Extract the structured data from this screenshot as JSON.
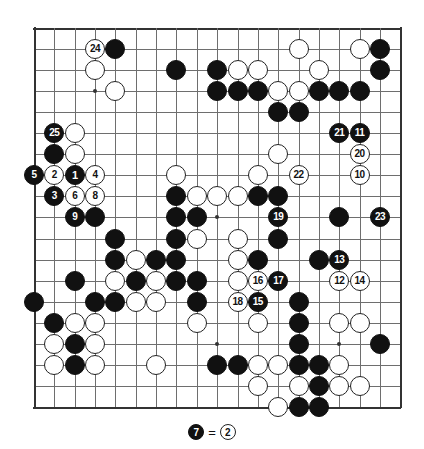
{
  "board": {
    "size": 19,
    "title": "Go game diagram",
    "geometry": {
      "left": 34,
      "top": 28,
      "x_step": 20.35,
      "y_step": 21.05,
      "stone_diameter": 20
    },
    "colors": {
      "black": "#111111",
      "white": "#ffffff",
      "line": "#6e6e6e",
      "edge": "#333333",
      "background": "#ffffff"
    },
    "star_points": [
      {
        "col": 4,
        "row": 4
      },
      {
        "col": 10,
        "row": 4
      },
      {
        "col": 16,
        "row": 4
      },
      {
        "col": 4,
        "row": 10
      },
      {
        "col": 10,
        "row": 10
      },
      {
        "col": 16,
        "row": 10
      },
      {
        "col": 4,
        "row": 16
      },
      {
        "col": 10,
        "row": 16
      },
      {
        "col": 16,
        "row": 16
      }
    ],
    "stones": [
      {
        "col": 4,
        "row": 2,
        "color": "white",
        "label": "24"
      },
      {
        "col": 5,
        "row": 2,
        "color": "black",
        "label": ""
      },
      {
        "col": 14,
        "row": 2,
        "color": "white",
        "label": ""
      },
      {
        "col": 17,
        "row": 2,
        "color": "white",
        "label": ""
      },
      {
        "col": 18,
        "row": 2,
        "color": "black",
        "label": ""
      },
      {
        "col": 4,
        "row": 3,
        "color": "white",
        "label": ""
      },
      {
        "col": 8,
        "row": 3,
        "color": "black",
        "label": ""
      },
      {
        "col": 10,
        "row": 3,
        "color": "black",
        "label": ""
      },
      {
        "col": 11,
        "row": 3,
        "color": "white",
        "label": ""
      },
      {
        "col": 12,
        "row": 3,
        "color": "white",
        "label": ""
      },
      {
        "col": 15,
        "row": 3,
        "color": "white",
        "label": ""
      },
      {
        "col": 18,
        "row": 3,
        "color": "black",
        "label": ""
      },
      {
        "col": 5,
        "row": 4,
        "color": "white",
        "label": ""
      },
      {
        "col": 10,
        "row": 4,
        "color": "black",
        "label": ""
      },
      {
        "col": 11,
        "row": 4,
        "color": "black",
        "label": ""
      },
      {
        "col": 12,
        "row": 4,
        "color": "black",
        "label": ""
      },
      {
        "col": 13,
        "row": 4,
        "color": "white",
        "label": ""
      },
      {
        "col": 14,
        "row": 4,
        "color": "white",
        "label": ""
      },
      {
        "col": 15,
        "row": 4,
        "color": "black",
        "label": ""
      },
      {
        "col": 16,
        "row": 4,
        "color": "black",
        "label": ""
      },
      {
        "col": 17,
        "row": 4,
        "color": "black",
        "label": ""
      },
      {
        "col": 13,
        "row": 5,
        "color": "black",
        "label": ""
      },
      {
        "col": 14,
        "row": 5,
        "color": "black",
        "label": ""
      },
      {
        "col": 2,
        "row": 6,
        "color": "black",
        "label": "25"
      },
      {
        "col": 3,
        "row": 6,
        "color": "white",
        "label": ""
      },
      {
        "col": 16,
        "row": 6,
        "color": "black",
        "label": "21"
      },
      {
        "col": 17,
        "row": 6,
        "color": "black",
        "label": "11"
      },
      {
        "col": 2,
        "row": 7,
        "color": "black",
        "label": ""
      },
      {
        "col": 3,
        "row": 7,
        "color": "white",
        "label": ""
      },
      {
        "col": 13,
        "row": 7,
        "color": "white",
        "label": ""
      },
      {
        "col": 17,
        "row": 7,
        "color": "white",
        "label": "20"
      },
      {
        "col": 1,
        "row": 8,
        "color": "black",
        "label": "5"
      },
      {
        "col": 2,
        "row": 8,
        "color": "white",
        "label": "2"
      },
      {
        "col": 3,
        "row": 8,
        "color": "black",
        "label": "1"
      },
      {
        "col": 4,
        "row": 8,
        "color": "white",
        "label": "4"
      },
      {
        "col": 8,
        "row": 8,
        "color": "white",
        "label": ""
      },
      {
        "col": 12,
        "row": 8,
        "color": "white",
        "label": ""
      },
      {
        "col": 14,
        "row": 8,
        "color": "white",
        "label": "22"
      },
      {
        "col": 17,
        "row": 8,
        "color": "white",
        "label": "10"
      },
      {
        "col": 2,
        "row": 9,
        "color": "black",
        "label": "3"
      },
      {
        "col": 3,
        "row": 9,
        "color": "white",
        "label": "6"
      },
      {
        "col": 4,
        "row": 9,
        "color": "white",
        "label": "8"
      },
      {
        "col": 8,
        "row": 9,
        "color": "black",
        "label": ""
      },
      {
        "col": 9,
        "row": 9,
        "color": "white",
        "label": ""
      },
      {
        "col": 10,
        "row": 9,
        "color": "white",
        "label": ""
      },
      {
        "col": 11,
        "row": 9,
        "color": "white",
        "label": ""
      },
      {
        "col": 12,
        "row": 9,
        "color": "black",
        "label": ""
      },
      {
        "col": 13,
        "row": 9,
        "color": "black",
        "label": ""
      },
      {
        "col": 3,
        "row": 10,
        "color": "black",
        "label": "9"
      },
      {
        "col": 4,
        "row": 10,
        "color": "black",
        "label": ""
      },
      {
        "col": 8,
        "row": 10,
        "color": "black",
        "label": ""
      },
      {
        "col": 9,
        "row": 10,
        "color": "black",
        "label": ""
      },
      {
        "col": 13,
        "row": 10,
        "color": "black",
        "label": "19"
      },
      {
        "col": 16,
        "row": 10,
        "color": "black",
        "label": ""
      },
      {
        "col": 18,
        "row": 10,
        "color": "black",
        "label": "23"
      },
      {
        "col": 5,
        "row": 11,
        "color": "black",
        "label": ""
      },
      {
        "col": 8,
        "row": 11,
        "color": "black",
        "label": ""
      },
      {
        "col": 9,
        "row": 11,
        "color": "white",
        "label": ""
      },
      {
        "col": 11,
        "row": 11,
        "color": "white",
        "label": ""
      },
      {
        "col": 13,
        "row": 11,
        "color": "black",
        "label": ""
      },
      {
        "col": 5,
        "row": 12,
        "color": "black",
        "label": ""
      },
      {
        "col": 6,
        "row": 12,
        "color": "white",
        "label": ""
      },
      {
        "col": 7,
        "row": 12,
        "color": "black",
        "label": ""
      },
      {
        "col": 8,
        "row": 12,
        "color": "black",
        "label": ""
      },
      {
        "col": 11,
        "row": 12,
        "color": "white",
        "label": ""
      },
      {
        "col": 12,
        "row": 12,
        "color": "black",
        "label": ""
      },
      {
        "col": 15,
        "row": 12,
        "color": "black",
        "label": ""
      },
      {
        "col": 16,
        "row": 12,
        "color": "black",
        "label": "13"
      },
      {
        "col": 3,
        "row": 13,
        "color": "black",
        "label": ""
      },
      {
        "col": 5,
        "row": 13,
        "color": "white",
        "label": ""
      },
      {
        "col": 6,
        "row": 13,
        "color": "black",
        "label": ""
      },
      {
        "col": 7,
        "row": 13,
        "color": "white",
        "label": ""
      },
      {
        "col": 8,
        "row": 13,
        "color": "black",
        "label": ""
      },
      {
        "col": 9,
        "row": 13,
        "color": "black",
        "label": ""
      },
      {
        "col": 11,
        "row": 13,
        "color": "white",
        "label": ""
      },
      {
        "col": 12,
        "row": 13,
        "color": "white",
        "label": "16"
      },
      {
        "col": 13,
        "row": 13,
        "color": "black",
        "label": "17"
      },
      {
        "col": 16,
        "row": 13,
        "color": "white",
        "label": "12"
      },
      {
        "col": 17,
        "row": 13,
        "color": "white",
        "label": "14"
      },
      {
        "col": 1,
        "row": 14,
        "color": "black",
        "label": ""
      },
      {
        "col": 4,
        "row": 14,
        "color": "black",
        "label": ""
      },
      {
        "col": 5,
        "row": 14,
        "color": "black",
        "label": ""
      },
      {
        "col": 6,
        "row": 14,
        "color": "white",
        "label": ""
      },
      {
        "col": 7,
        "row": 14,
        "color": "white",
        "label": ""
      },
      {
        "col": 9,
        "row": 14,
        "color": "black",
        "label": ""
      },
      {
        "col": 11,
        "row": 14,
        "color": "white",
        "label": "18"
      },
      {
        "col": 12,
        "row": 14,
        "color": "black",
        "label": "15"
      },
      {
        "col": 14,
        "row": 14,
        "color": "black",
        "label": ""
      },
      {
        "col": 2,
        "row": 15,
        "color": "black",
        "label": ""
      },
      {
        "col": 3,
        "row": 15,
        "color": "white",
        "label": ""
      },
      {
        "col": 4,
        "row": 15,
        "color": "white",
        "label": ""
      },
      {
        "col": 9,
        "row": 15,
        "color": "white",
        "label": ""
      },
      {
        "col": 12,
        "row": 15,
        "color": "white",
        "label": ""
      },
      {
        "col": 14,
        "row": 15,
        "color": "black",
        "label": ""
      },
      {
        "col": 16,
        "row": 15,
        "color": "white",
        "label": ""
      },
      {
        "col": 17,
        "row": 15,
        "color": "white",
        "label": ""
      },
      {
        "col": 2,
        "row": 16,
        "color": "white",
        "label": ""
      },
      {
        "col": 3,
        "row": 16,
        "color": "black",
        "label": ""
      },
      {
        "col": 4,
        "row": 16,
        "color": "white",
        "label": ""
      },
      {
        "col": 14,
        "row": 16,
        "color": "black",
        "label": ""
      },
      {
        "col": 18,
        "row": 16,
        "color": "black",
        "label": ""
      },
      {
        "col": 2,
        "row": 17,
        "color": "white",
        "label": ""
      },
      {
        "col": 3,
        "row": 17,
        "color": "black",
        "label": ""
      },
      {
        "col": 4,
        "row": 17,
        "color": "white",
        "label": ""
      },
      {
        "col": 7,
        "row": 17,
        "color": "white",
        "label": ""
      },
      {
        "col": 10,
        "row": 17,
        "color": "black",
        "label": ""
      },
      {
        "col": 11,
        "row": 17,
        "color": "black",
        "label": ""
      },
      {
        "col": 12,
        "row": 17,
        "color": "white",
        "label": ""
      },
      {
        "col": 13,
        "row": 17,
        "color": "white",
        "label": ""
      },
      {
        "col": 14,
        "row": 17,
        "color": "black",
        "label": ""
      },
      {
        "col": 15,
        "row": 17,
        "color": "black",
        "label": ""
      },
      {
        "col": 16,
        "row": 17,
        "color": "white",
        "label": ""
      },
      {
        "col": 12,
        "row": 18,
        "color": "white",
        "label": ""
      },
      {
        "col": 14,
        "row": 18,
        "color": "white",
        "label": ""
      },
      {
        "col": 15,
        "row": 18,
        "color": "black",
        "label": ""
      },
      {
        "col": 16,
        "row": 18,
        "color": "white",
        "label": ""
      },
      {
        "col": 17,
        "row": 18,
        "color": "white",
        "label": ""
      },
      {
        "col": 13,
        "row": 19,
        "color": "white",
        "label": ""
      },
      {
        "col": 14,
        "row": 19,
        "color": "black",
        "label": ""
      },
      {
        "col": 15,
        "row": 19,
        "color": "black",
        "label": ""
      }
    ]
  },
  "caption": {
    "move_black": "7",
    "equals": "=",
    "move_white": "2",
    "text": "7 = 2"
  }
}
